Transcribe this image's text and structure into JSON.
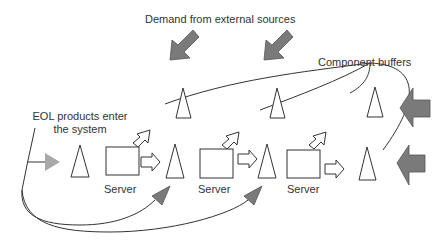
{
  "diagram": {
    "labels": {
      "demand": "Demand from external sources",
      "component_buffers": "Component buffers",
      "eol_line1": "EOL products enter",
      "eol_line2": "the system",
      "server1": "Server",
      "server2": "Server",
      "server3": "Server"
    },
    "colors": {
      "stroke": "#333333",
      "dark_arrow": "#7a7a7a",
      "light_arrow": "#a9a9a9",
      "background": "#ffffff"
    },
    "nodes": {
      "buffers_bottom": 4,
      "buffers_top": 3,
      "servers": 3
    }
  }
}
